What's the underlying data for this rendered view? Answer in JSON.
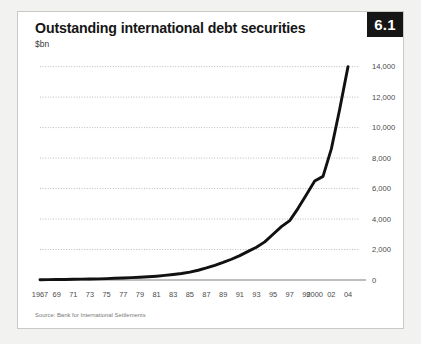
{
  "card": {
    "title": "Outstanding international debt securities",
    "subtitle": "$bn",
    "badge": "6.1",
    "source": "Source: Bank for International Settlements"
  },
  "colors": {
    "page_background": "#f2f2f0",
    "card_background": "#ffffff",
    "card_border": "#c9c9c7",
    "badge_background": "#151515",
    "badge_text": "#ffffff",
    "line": "#111111",
    "gridline": "#b4b4b2",
    "axis": "#a8a8a6",
    "tick_text": "#4a4a4a",
    "accent_tab": "#c2c2c0"
  },
  "chart_data": {
    "type": "line",
    "title": "Outstanding international debt securities",
    "subtitle": "$bn",
    "xlabel": "",
    "ylabel": "$bn",
    "grid": true,
    "legend": false,
    "xlim": [
      1967,
      2004
    ],
    "ylim": [
      0,
      14500
    ],
    "ytick_values": [
      0,
      2000,
      4000,
      6000,
      8000,
      10000,
      12000,
      14000
    ],
    "ytick_labels": [
      "0",
      "2,000",
      "4,000",
      "6,000",
      "8,000",
      "10,000",
      "12,000",
      "14,000"
    ],
    "xtick_values": [
      1967,
      1969,
      1971,
      1973,
      1975,
      1977,
      1979,
      1981,
      1983,
      1985,
      1987,
      1989,
      1991,
      1993,
      1995,
      1997,
      1999,
      2000,
      2002,
      2004
    ],
    "xtick_labels": [
      "1967",
      "69",
      "71",
      "73",
      "75",
      "77",
      "79",
      "81",
      "83",
      "85",
      "87",
      "89",
      "91",
      "93",
      "95",
      "97",
      "99",
      "2000",
      "02",
      "04"
    ],
    "series": [
      {
        "name": "Outstanding international debt securities",
        "x": [
          1967,
          1968,
          1969,
          1970,
          1971,
          1972,
          1973,
          1974,
          1975,
          1976,
          1977,
          1978,
          1979,
          1980,
          1981,
          1982,
          1983,
          1984,
          1985,
          1986,
          1987,
          1988,
          1989,
          1990,
          1991,
          1992,
          1993,
          1994,
          1995,
          1996,
          1997,
          1998,
          1999,
          2000,
          2001,
          2002,
          2003,
          2004
        ],
        "values": [
          20,
          25,
          30,
          35,
          45,
          55,
          65,
          75,
          90,
          110,
          130,
          155,
          180,
          210,
          250,
          300,
          360,
          430,
          520,
          640,
          790,
          960,
          1150,
          1360,
          1600,
          1880,
          2150,
          2500,
          3000,
          3500,
          3900,
          4700,
          5600,
          6500,
          6800,
          8600,
          11200,
          14000
        ]
      }
    ]
  }
}
